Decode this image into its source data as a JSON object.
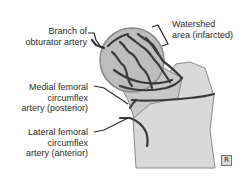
{
  "diagram": {
    "colors": {
      "bone_fill": "#d9d9d9",
      "head_fill": "#bdbdbd",
      "outline": "#8a8a8a",
      "artery": "#3a3a3a",
      "text": "#2a2a2a"
    },
    "labels": {
      "branch_obturator": [
        "Branch of",
        "obturator artery"
      ],
      "watershed": [
        "Watershed",
        "area (infarcted)"
      ],
      "medial_circumflex": [
        "Medial femoral",
        "circumflex",
        "artery (posterior)"
      ],
      "lateral_circumflex": [
        "Lateral femoral",
        "circumflex",
        "artery (anterior)"
      ]
    },
    "badge": "R"
  }
}
